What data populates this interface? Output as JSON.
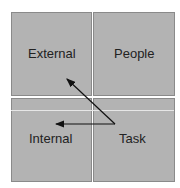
{
  "diagram": {
    "quadrants": [
      {
        "id": "external",
        "label": "External"
      },
      {
        "id": "people",
        "label": "People"
      },
      {
        "id": "internal",
        "label": "Internal"
      },
      {
        "id": "task",
        "label": "Task"
      }
    ],
    "arrows": [
      {
        "from": "task",
        "to": "external"
      },
      {
        "from": "task",
        "to": "internal"
      }
    ],
    "colors": {
      "fill": "#b3b3b3",
      "border": "#8a8a8a",
      "arrow": "#111111"
    }
  }
}
